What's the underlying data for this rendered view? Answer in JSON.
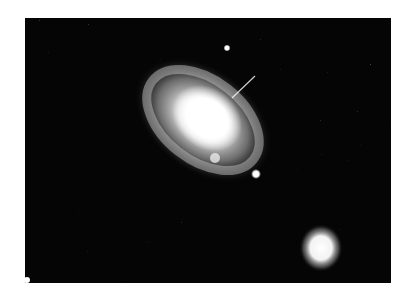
{
  "image": {
    "subject": "spiral galaxy with companion galaxy and foreground stars",
    "style": "grayscale astronomical photograph",
    "colors": {
      "background": "#ffffff",
      "sky": "#050505",
      "core": "#ffffff",
      "halo": "#bdbdbd"
    },
    "objects": [
      {
        "name": "spiral-galaxy",
        "description": "large tilted spiral galaxy with bright saturated core and knotty arms"
      },
      {
        "name": "companion-galaxy",
        "description": "small round bright elliptical blob, lower right"
      },
      {
        "name": "star",
        "description": "point source above the spiral galaxy"
      },
      {
        "name": "star",
        "description": "point source below-right of the spiral galaxy"
      }
    ]
  }
}
